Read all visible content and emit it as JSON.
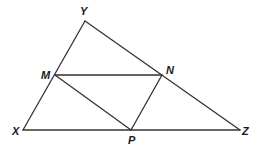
{
  "diagram": {
    "type": "geometry-triangle",
    "vertices": {
      "Y": {
        "label": "Y",
        "x": 85,
        "y": 21,
        "label_x": 80,
        "label_y": 15
      },
      "M": {
        "label": "M",
        "x": 55,
        "y": 75,
        "label_x": 41,
        "label_y": 79
      },
      "N": {
        "label": "N",
        "x": 162,
        "y": 75,
        "label_x": 166,
        "label_y": 74
      },
      "X": {
        "label": "X",
        "x": 23,
        "y": 130,
        "label_x": 12,
        "label_y": 135
      },
      "P": {
        "label": "P",
        "x": 131,
        "y": 130,
        "label_x": 128,
        "label_y": 144
      },
      "Z": {
        "label": "Z",
        "x": 240,
        "y": 130,
        "label_x": 242,
        "label_y": 135
      }
    },
    "segments": [
      {
        "from": "X",
        "to": "Y"
      },
      {
        "from": "Y",
        "to": "Z"
      },
      {
        "from": "X",
        "to": "Z"
      },
      {
        "from": "M",
        "to": "N"
      },
      {
        "from": "M",
        "to": "P"
      },
      {
        "from": "N",
        "to": "P"
      }
    ],
    "line_color": "#333333"
  }
}
